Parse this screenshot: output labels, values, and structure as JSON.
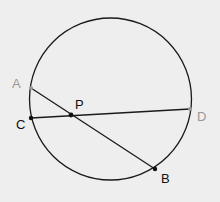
{
  "diagram": {
    "background": "#eeeeee",
    "circle": {
      "cx": 110.5,
      "cy": 99,
      "r": 81,
      "stroke": "#1a1a1a"
    },
    "points": {
      "A": {
        "label": "A",
        "x": 31,
        "y": 88,
        "color": "#999999",
        "label_x": 12,
        "label_y": 88
      },
      "B": {
        "label": "B",
        "x": 155,
        "y": 169,
        "color": "#111111",
        "label_x": 161,
        "label_y": 183
      },
      "C": {
        "label": "C",
        "x": 31,
        "y": 118,
        "color": "#111111",
        "label_x": 16,
        "label_y": 129
      },
      "D": {
        "label": "D",
        "x": 190,
        "y": 109,
        "color": "#999999",
        "label_x": 197,
        "label_y": 121
      },
      "P": {
        "label": "P",
        "x": 71,
        "y": 115,
        "color": "#111111",
        "label_x": 75,
        "label_y": 109
      }
    },
    "chords": [
      {
        "name": "AB",
        "from": "A",
        "to": "B"
      },
      {
        "name": "CD",
        "from": "C",
        "to": "D"
      }
    ]
  }
}
